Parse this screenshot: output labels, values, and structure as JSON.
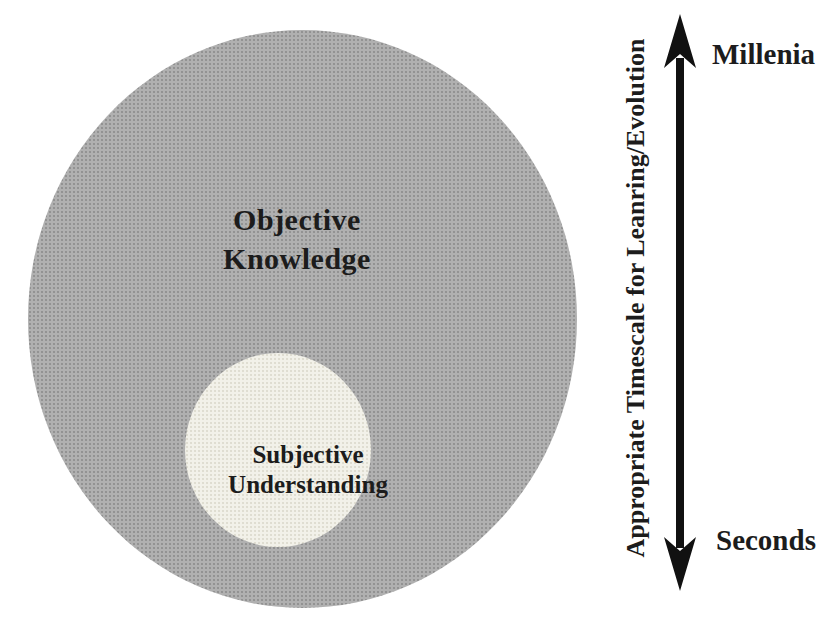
{
  "diagram": {
    "outer_circle": {
      "label_line1": "Objective",
      "label_line2": "Knowledge"
    },
    "inner_circle": {
      "label_line1": "Subjective",
      "label_line2": "Understanding"
    },
    "axis": {
      "top_label": "Millenia",
      "bottom_label": "Seconds",
      "title": "Appropriate Timescale for Leanring/Evolution"
    },
    "colors": {
      "background": "#ffffff",
      "outer_circle_fill": "#b0b0b0",
      "inner_circle_fill": "#f2f1e9",
      "text": "#1c1c1c",
      "arrow": "#111111"
    }
  }
}
